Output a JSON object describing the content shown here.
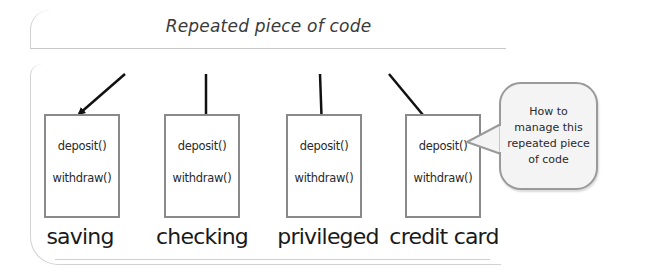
{
  "title": "Repeated piece of code",
  "classes": [
    {
      "name": "saving",
      "methods": [
        "deposit()",
        "withdraw()"
      ]
    },
    {
      "name": "checking",
      "methods": [
        "deposit()",
        "withdraw()"
      ]
    },
    {
      "name": "privileged",
      "methods": [
        "deposit()",
        "withdraw()"
      ]
    },
    {
      "name": "credit card",
      "methods": [
        "deposit()",
        "withdraw()"
      ]
    }
  ],
  "callout": {
    "lines": [
      "How to",
      "manage this",
      "repeated piece",
      "of code"
    ]
  },
  "colors": {
    "arrow": "#111111",
    "box_border": "#8a8a8a",
    "bubble_fill": "#f4f4f4",
    "bubble_border": "#9a9a9a"
  }
}
